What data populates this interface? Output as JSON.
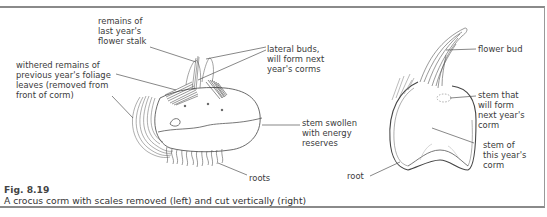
{
  "figure": {
    "number": "Fig. 8.19",
    "caption": "A crocus corm with scales removed (left) and cut vertically (right)"
  },
  "left_diagram": {
    "subject": "crocus corm with scales removed",
    "labels": {
      "flower_stalk": "remains of\nlast year's\nflower stalk",
      "foliage": "withered remains of\nprevious year's foliage\nleaves (removed from\nfront of corm)",
      "lateral_buds": "lateral buds,\nwill form next\nyear's corms",
      "stem_swollen": "stem swollen\nwith energy\nreserves",
      "roots": "roots"
    }
  },
  "right_diagram": {
    "subject": "crocus corm cut vertically",
    "labels": {
      "flower_bud": "flower bud",
      "stem_next": "stem that\nwill form\nnext year's\ncorm",
      "stem_this": "stem of\nthis year's\ncorm",
      "root": "root"
    }
  }
}
